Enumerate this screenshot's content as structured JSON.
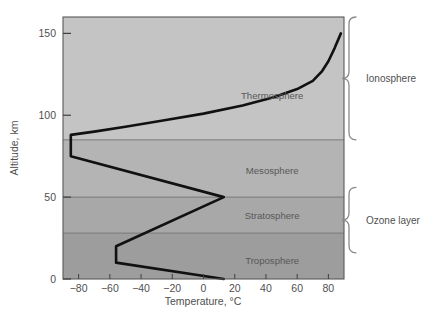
{
  "chart_data": {
    "type": "line",
    "title": "",
    "xlabel": "Temperature, °C",
    "ylabel": "Altitude, km",
    "xlim": [
      -90,
      90
    ],
    "ylim": [
      0,
      160
    ],
    "xticks": [
      -80,
      -60,
      -40,
      -20,
      0,
      20,
      40,
      60,
      80
    ],
    "xtick_labels": [
      "−80",
      "−60",
      "−40",
      "−20",
      "0",
      "20",
      "40",
      "60",
      "80"
    ],
    "yticks": [
      0,
      50,
      100,
      150
    ],
    "ytick_labels": [
      "0",
      "50",
      "100",
      "150"
    ],
    "grid": false,
    "legend": "none",
    "series": [
      {
        "name": "Temperature profile",
        "color": "#111111",
        "x": [
          13,
          -56,
          -56,
          13,
          -85,
          -85,
          -70,
          -50,
          -25,
          0,
          25,
          45,
          60,
          70,
          76,
          80,
          84,
          88
        ],
        "y": [
          0,
          10,
          20,
          50,
          75,
          88,
          90,
          93,
          97,
          101,
          106,
          111,
          116,
          121,
          127,
          133,
          141,
          150
        ]
      }
    ],
    "bands": [
      {
        "name": "Troposphere",
        "y0": 0,
        "y1": 28,
        "color": "#9d9d9d",
        "label_x": 44,
        "label_y": 11
      },
      {
        "name": "Stratosphere",
        "y0": 28,
        "y1": 50,
        "color": "#a8a8a8",
        "label_x": 44,
        "label_y": 39
      },
      {
        "name": "Mesosphere",
        "y0": 50,
        "y1": 85,
        "color": "#b4b4b4",
        "label_x": 44,
        "label_y": 66
      },
      {
        "name": "Thermosphere",
        "y0": 85,
        "y1": 160,
        "color": "#c4c4c4",
        "label_x": 44,
        "label_y": 112
      }
    ],
    "brackets": [
      {
        "name": "Ionosphere",
        "y0": 85,
        "y1": 160,
        "label": "Ionosphere"
      },
      {
        "name": "Ozone layer",
        "y0": 16,
        "y1": 56,
        "label": "Ozone layer"
      }
    ],
    "colors": {
      "axis": "#4a4a4a",
      "curve": "#111111",
      "band_line": "#6f6f6f",
      "text": "#5a5a5a",
      "bracket": "#8a8a8a",
      "background": "#ffffff"
    }
  }
}
